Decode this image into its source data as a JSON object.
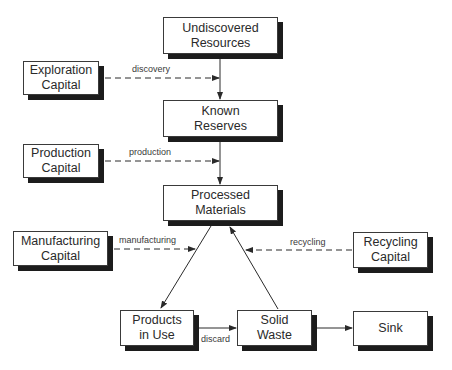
{
  "diagram": {
    "nodes": [
      {
        "id": "undiscovered",
        "lines": [
          "Undiscovered",
          "Resources"
        ],
        "x": 163,
        "y": 17,
        "w": 115,
        "h": 37
      },
      {
        "id": "exploration",
        "lines": [
          "Exploration",
          "Capital"
        ],
        "x": 23,
        "y": 61,
        "w": 76,
        "h": 34
      },
      {
        "id": "known",
        "lines": [
          "Known",
          "Reserves"
        ],
        "x": 163,
        "y": 100,
        "w": 115,
        "h": 37
      },
      {
        "id": "production",
        "lines": [
          "Production",
          "Capital"
        ],
        "x": 23,
        "y": 144,
        "w": 76,
        "h": 34
      },
      {
        "id": "processed",
        "lines": [
          "Processed",
          "Materials"
        ],
        "x": 163,
        "y": 185,
        "w": 115,
        "h": 36
      },
      {
        "id": "manufacturing",
        "lines": [
          "Manufacturing",
          "Capital"
        ],
        "x": 13,
        "y": 231,
        "w": 95,
        "h": 35
      },
      {
        "id": "recycling",
        "lines": [
          "Recycling",
          "Capital"
        ],
        "x": 353,
        "y": 232,
        "w": 75,
        "h": 36
      },
      {
        "id": "products",
        "lines": [
          "Products",
          "in Use"
        ],
        "x": 120,
        "y": 310,
        "w": 74,
        "h": 36
      },
      {
        "id": "solid",
        "lines": [
          "Solid",
          "Waste"
        ],
        "x": 237,
        "y": 310,
        "w": 75,
        "h": 36
      },
      {
        "id": "sink",
        "lines": [
          "Sink"
        ],
        "x": 353,
        "y": 311,
        "w": 75,
        "h": 35
      }
    ],
    "edge_labels": {
      "discovery": "discovery",
      "production": "production",
      "manufacturing": "manufacturing",
      "recycling": "recycling",
      "discard": "discard"
    },
    "edges": [
      {
        "from": "undiscovered",
        "to": "known",
        "style": "solid"
      },
      {
        "from": "known",
        "to": "processed",
        "style": "solid"
      },
      {
        "from": "exploration",
        "to": "undiscovered-known-link",
        "label": "discovery",
        "style": "dashed"
      },
      {
        "from": "production",
        "to": "known-processed-link",
        "label": "production",
        "style": "dashed"
      },
      {
        "from": "processed",
        "to": "products",
        "style": "solid"
      },
      {
        "from": "manufacturing",
        "to": "processed-products-link",
        "label": "manufacturing",
        "style": "dashed"
      },
      {
        "from": "solid",
        "to": "processed",
        "style": "solid"
      },
      {
        "from": "recycling",
        "to": "solid-processed-link",
        "label": "recycling",
        "style": "dashed"
      },
      {
        "from": "products",
        "to": "solid",
        "label": "discard",
        "style": "solid"
      },
      {
        "from": "solid",
        "to": "sink",
        "style": "solid"
      }
    ],
    "colors": {
      "line": "#2a2a2a",
      "shadow": "#1c1c1c",
      "border": "#3a3a3a"
    }
  }
}
